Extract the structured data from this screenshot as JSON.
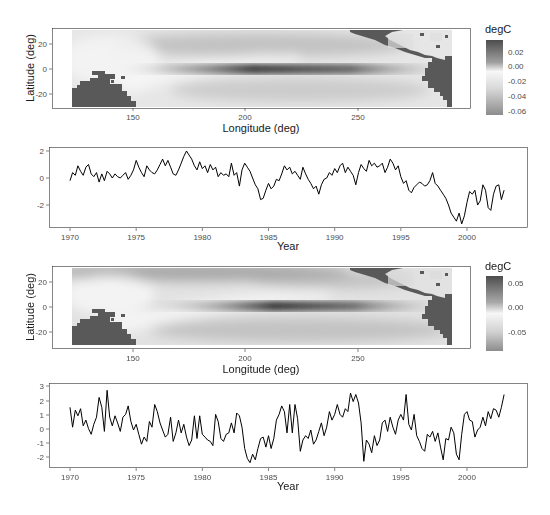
{
  "chart_data": [
    {
      "type": "heatmap",
      "panel": 1,
      "title": "",
      "xlabel": "Longitude (deg)",
      "ylabel": "Latitude (deg)",
      "xticks": [
        150,
        200,
        250
      ],
      "yticks": [
        20,
        0,
        -20
      ],
      "xlim": [
        124,
        294
      ],
      "ylim": [
        -32,
        32
      ],
      "legend": {
        "title": "degC",
        "ticks": [
          "0.02",
          "0.00",
          "-0.02",
          "-0.04",
          "-0.06"
        ],
        "range": [
          -0.07,
          0.035
        ],
        "colors": {
          "high": "#4d4d4d",
          "mid": "#f7f7f7",
          "low": "#8c8c8c"
        }
      },
      "land_color": "#595959",
      "features": "Dark equatorial band centered near longitude 200 at latitude 0; land masses masked lower-left (Australia/Indonesia) and right (Americas)"
    },
    {
      "type": "line",
      "panel": 2,
      "xlabel": "Year",
      "ylabel": "",
      "xticks": [
        1970,
        1975,
        1980,
        1985,
        1990,
        1995,
        2000
      ],
      "yticks": [
        2,
        0,
        -2
      ],
      "xlim": [
        1968.4,
        2004.5
      ],
      "ylim": [
        -3.9,
        2.4
      ],
      "series": [
        {
          "name": "series1",
          "x": [
            1970.0,
            1970.2,
            1970.4,
            1970.6,
            1970.8,
            1971.0,
            1971.2,
            1971.4,
            1971.6,
            1971.8,
            1972.0,
            1972.2,
            1972.4,
            1972.6,
            1972.8,
            1973.0,
            1973.2,
            1973.4,
            1973.6,
            1973.8,
            1974.0,
            1974.2,
            1974.4,
            1974.6,
            1974.8,
            1975.0,
            1975.2,
            1975.4,
            1975.6,
            1975.8,
            1976.0,
            1976.2,
            1976.4,
            1976.6,
            1976.8,
            1977.0,
            1977.2,
            1977.4,
            1977.6,
            1977.8,
            1978.0,
            1978.2,
            1978.4,
            1978.6,
            1978.8,
            1979.0,
            1979.2,
            1979.4,
            1979.6,
            1979.8,
            1980.0,
            1980.2,
            1980.4,
            1980.6,
            1980.8,
            1981.0,
            1981.2,
            1981.4,
            1981.6,
            1981.8,
            1982.0,
            1982.2,
            1982.4,
            1982.6,
            1982.8,
            1983.0,
            1983.2,
            1983.4,
            1983.6,
            1983.8,
            1984.0,
            1984.2,
            1984.4,
            1984.6,
            1984.8,
            1985.0,
            1985.2,
            1985.4,
            1985.6,
            1985.8,
            1986.0,
            1986.2,
            1986.4,
            1986.6,
            1986.8,
            1987.0,
            1987.2,
            1987.4,
            1987.6,
            1987.8,
            1988.0,
            1988.2,
            1988.4,
            1988.6,
            1988.8,
            1989.0,
            1989.2,
            1989.4,
            1989.6,
            1989.8,
            1990.0,
            1990.2,
            1990.4,
            1990.6,
            1990.8,
            1991.0,
            1991.2,
            1991.4,
            1991.6,
            1991.8,
            1992.0,
            1992.2,
            1992.4,
            1992.6,
            1992.8,
            1993.0,
            1993.2,
            1993.4,
            1993.6,
            1993.8,
            1994.0,
            1994.2,
            1994.4,
            1994.6,
            1994.8,
            1995.0,
            1995.2,
            1995.4,
            1995.6,
            1995.8,
            1996.0,
            1996.2,
            1996.4,
            1996.6,
            1996.8,
            1997.0,
            1997.2,
            1997.4,
            1997.6,
            1997.8,
            1998.0,
            1998.2,
            1998.4,
            1998.6,
            1998.8,
            1999.0,
            1999.2,
            1999.4,
            1999.6,
            1999.8,
            2000.0,
            2000.2,
            2000.4,
            2000.6,
            2000.8,
            2001.0,
            2001.2,
            2001.4,
            2001.6,
            2001.8,
            2002.0,
            2002.2,
            2002.4,
            2002.6,
            2002.8
          ],
          "values": [
            -0.2,
            0.4,
            0.2,
            0.9,
            0.5,
            0.2,
            0.8,
            1.0,
            0.3,
            0.1,
            0.4,
            -0.3,
            0.3,
            -0.2,
            0.5,
            0.3,
            0.0,
            0.3,
            0.1,
            0.0,
            0.2,
            0.4,
            -0.1,
            0.2,
            0.6,
            1.3,
            0.8,
            0.4,
            0.1,
            0.9,
            0.6,
            0.4,
            0.3,
            0.6,
            1.0,
            1.4,
            0.9,
            1.3,
            0.8,
            0.3,
            0.2,
            0.6,
            1.1,
            1.6,
            2.0,
            1.7,
            1.4,
            0.9,
            0.6,
            1.2,
            0.7,
            0.9,
            0.4,
            1.0,
            0.6,
            0.8,
            0.1,
            0.4,
            0.2,
            0.3,
            0.1,
            1.1,
            0.2,
            0.4,
            -0.6,
            0.6,
            1.1,
            0.8,
            0.5,
            0.0,
            -0.5,
            -0.8,
            -1.6,
            -1.5,
            -0.9,
            -0.4,
            -0.8,
            -0.6,
            -0.1,
            -0.2,
            0.3,
            0.9,
            0.6,
            0.8,
            0.3,
            0.5,
            0.2,
            -0.1,
            0.8,
            0.3,
            -0.1,
            -0.4,
            -0.8,
            -0.6,
            -1.2,
            -0.5,
            -0.1,
            0.0,
            0.4,
            0.2,
            0.7,
            0.4,
            0.9,
            1.1,
            0.4,
            0.8,
            0.5,
            0.2,
            -0.5,
            0.4,
            1.0,
            0.7,
            0.5,
            1.3,
            0.9,
            1.1,
            0.8,
            0.9,
            1.1,
            0.4,
            0.8,
            1.4,
            1.1,
            0.6,
            0.9,
            0.1,
            -0.4,
            -0.2,
            -0.9,
            -1.1,
            -0.7,
            -0.5,
            -0.3,
            -0.4,
            -0.6,
            -0.5,
            -0.2,
            0.4,
            -0.4,
            -0.6,
            -0.9,
            -1.2,
            -1.5,
            -2.0,
            -2.6,
            -2.9,
            -3.2,
            -2.6,
            -3.4,
            -2.8,
            -1.8,
            -1.0,
            -1.2,
            -0.9,
            -2.0,
            -1.7,
            -0.5,
            -0.9,
            -2.2,
            -2.4,
            -1.2,
            -0.6,
            -0.5,
            -1.6,
            -0.9,
            -0.5,
            -0.6
          ]
        }
      ]
    },
    {
      "type": "heatmap",
      "panel": 3,
      "title": "",
      "xlabel": "Longitude (deg)",
      "ylabel": "Latitude (deg)",
      "xticks": [
        150,
        200,
        250
      ],
      "yticks": [
        20,
        0,
        -20
      ],
      "xlim": [
        124,
        294
      ],
      "ylim": [
        -32,
        32
      ],
      "legend": {
        "title": "degC",
        "ticks": [
          "0.05",
          "0.00",
          "-0.05"
        ],
        "range": [
          -0.09,
          0.07
        ],
        "colors": {
          "high": "#4d4d4d",
          "mid": "#f7f7f7",
          "low": "#8c8c8c"
        }
      },
      "land_color": "#595959",
      "features": "Dark equatorial band centered near longitude 200; darker band along top edge near latitude 25; land masses masked"
    },
    {
      "type": "line",
      "panel": 4,
      "xlabel": "Year",
      "ylabel": "",
      "xticks": [
        1970,
        1975,
        1980,
        1985,
        1990,
        1995,
        2000
      ],
      "yticks": [
        3,
        2,
        1,
        0,
        -1,
        -2
      ],
      "xlim": [
        1968.4,
        2004.5
      ],
      "ylim": [
        -2.6,
        3.2
      ],
      "series": [
        {
          "name": "series2",
          "x": [
            1970.0,
            1970.2,
            1970.4,
            1970.6,
            1970.8,
            1971.0,
            1971.2,
            1971.4,
            1971.6,
            1971.8,
            1972.0,
            1972.2,
            1972.4,
            1972.6,
            1972.8,
            1973.0,
            1973.2,
            1973.4,
            1973.6,
            1973.8,
            1974.0,
            1974.2,
            1974.4,
            1974.6,
            1974.8,
            1975.0,
            1975.2,
            1975.4,
            1975.6,
            1975.8,
            1976.0,
            1976.2,
            1976.4,
            1976.6,
            1976.8,
            1977.0,
            1977.2,
            1977.4,
            1977.6,
            1977.8,
            1978.0,
            1978.2,
            1978.4,
            1978.6,
            1978.8,
            1979.0,
            1979.2,
            1979.4,
            1979.6,
            1979.8,
            1980.0,
            1980.2,
            1980.4,
            1980.6,
            1980.8,
            1981.0,
            1981.2,
            1981.4,
            1981.6,
            1981.8,
            1982.0,
            1982.2,
            1982.4,
            1982.6,
            1982.8,
            1983.0,
            1983.2,
            1983.4,
            1983.6,
            1983.8,
            1984.0,
            1984.2,
            1984.4,
            1984.6,
            1984.8,
            1985.0,
            1985.2,
            1985.4,
            1985.6,
            1985.8,
            1986.0,
            1986.2,
            1986.4,
            1986.6,
            1986.8,
            1987.0,
            1987.2,
            1987.4,
            1987.6,
            1987.8,
            1988.0,
            1988.2,
            1988.4,
            1988.6,
            1988.8,
            1989.0,
            1989.2,
            1989.4,
            1989.6,
            1989.8,
            1990.0,
            1990.2,
            1990.4,
            1990.6,
            1990.8,
            1991.0,
            1991.2,
            1991.4,
            1991.6,
            1991.8,
            1992.0,
            1992.2,
            1992.4,
            1992.6,
            1992.8,
            1993.0,
            1993.2,
            1993.4,
            1993.6,
            1993.8,
            1994.0,
            1994.2,
            1994.4,
            1994.6,
            1994.8,
            1995.0,
            1995.2,
            1995.4,
            1995.6,
            1995.8,
            1996.0,
            1996.2,
            1996.4,
            1996.6,
            1996.8,
            1997.0,
            1997.2,
            1997.4,
            1997.6,
            1997.8,
            1998.0,
            1998.2,
            1998.4,
            1998.6,
            1998.8,
            1999.0,
            1999.2,
            1999.4,
            1999.6,
            1999.8,
            2000.0,
            2000.2,
            2000.4,
            2000.6,
            2000.8,
            2001.0,
            2001.2,
            2001.4,
            2001.6,
            2001.8,
            2002.0,
            2002.2,
            2002.4,
            2002.6,
            2002.8
          ],
          "values": [
            1.5,
            0.1,
            1.3,
            0.9,
            1.4,
            0.2,
            0.6,
            0.0,
            -0.4,
            0.3,
            0.8,
            2.2,
            1.5,
            -0.2,
            2.7,
            0.8,
            0.2,
            0.9,
            0.4,
            -0.2,
            0.8,
            1.0,
            1.6,
            0.5,
            -0.1,
            0.3,
            -0.4,
            -1.1,
            -0.6,
            -0.9,
            0.5,
            0.1,
            1.7,
            1.2,
            0.4,
            -0.1,
            -0.6,
            -0.4,
            0.8,
            -0.9,
            -0.3,
            0.6,
            -0.3,
            0.3,
            -0.6,
            -1.2,
            -0.8,
            0.9,
            -0.7,
            0.9,
            -0.4,
            -0.6,
            -0.8,
            -0.9,
            -1.2,
            1.0,
            0.5,
            -0.7,
            -0.9,
            -0.4,
            -0.3,
            0.4,
            -0.3,
            1.1,
            0.9,
            0.1,
            -1.4,
            -2.1,
            -2.4,
            -1.8,
            -2.2,
            -1.4,
            -0.7,
            -0.6,
            -1.3,
            -0.5,
            -1.4,
            -0.7,
            0.6,
            1.0,
            1.6,
            1.2,
            -0.3,
            1.7,
            -0.3,
            1.7,
            0.7,
            -1.6,
            -0.8,
            -0.5,
            -0.7,
            -0.1,
            -1.1,
            -0.8,
            -0.2,
            0.4,
            -0.5,
            0.1,
            1.2,
            0.6,
            1.0,
            1.7,
            1.0,
            0.8,
            1.4,
            1.2,
            2.5,
            1.9,
            2.4,
            1.8,
            0.4,
            -2.3,
            -0.8,
            -1.1,
            -1.7,
            -0.5,
            -1.2,
            -0.8,
            0.4,
            0.6,
            -0.2,
            0.8,
            0.1,
            -0.4,
            0.6,
            1.0,
            0.6,
            2.4,
            0.3,
            -0.1,
            1.0,
            -0.5,
            -0.9,
            -1.4,
            -1.6,
            -0.4,
            -0.6,
            -0.2,
            -0.9,
            -0.3,
            -1.3,
            -2.2,
            -0.7,
            -0.8,
            0.1,
            -0.3,
            -1.8,
            -2.2,
            -0.4,
            1.0,
            1.2,
            0.6,
            0.5,
            -0.6,
            -0.1,
            0.1,
            0.8,
            0.2,
            1.2,
            0.7,
            1.4,
            1.3,
            0.8,
            1.5,
            2.4,
            1.7,
            2.8,
            2.6,
            2.4
          ]
        }
      ]
    }
  ]
}
